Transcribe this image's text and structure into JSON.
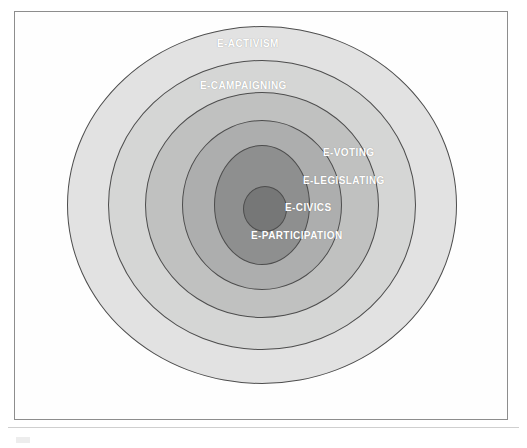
{
  "figure": {
    "frame_color": "#8d8d8d",
    "background": "#ffffff",
    "label_color": "#ffffff",
    "ring_outline_color": "#4d4d4d"
  },
  "chart_data": {
    "type": "pie",
    "title": "",
    "subtitle": "",
    "xlabel": "",
    "ylabel": "",
    "legend_position": "none",
    "grid": false,
    "layout": "concentric-rings",
    "center_label": "E-PARTICIPATION",
    "rings": [
      {
        "index": 1,
        "label": "E-ACTIVISM",
        "level": "outermost",
        "fill": "#e2e2e2",
        "radius_x": 195,
        "radius_y": 179,
        "label_position": "top"
      },
      {
        "index": 2,
        "label": "E-CAMPAIGNING",
        "level": "second",
        "fill": "#d5d6d5",
        "radius_x": 154,
        "radius_y": 145,
        "label_position": "top"
      },
      {
        "index": 3,
        "label": "E-VOTING",
        "level": "third",
        "fill": "#c0c1c0",
        "radius_x": 117,
        "radius_y": 113,
        "label_position": "right"
      },
      {
        "index": 4,
        "label": "E-LEGISLATING",
        "level": "fourth",
        "fill": "#adaeae",
        "radius_x": 80,
        "radius_y": 85,
        "label_position": "right"
      },
      {
        "index": 5,
        "label": "E-CIVICS",
        "level": "fifth",
        "fill": "#8e8f8f",
        "radius_x": 48,
        "radius_y": 60,
        "label_position": "right"
      },
      {
        "index": 6,
        "label": "E-PARTICIPATION",
        "level": "core",
        "fill": "#767777",
        "radius_x": 22,
        "radius_y": 23,
        "label_position": "center-right"
      }
    ],
    "labels": [
      "E-ACTIVISM",
      "E-CAMPAIGNING",
      "E-VOTING",
      "E-LEGISLATING",
      "E-CIVICS",
      "E-PARTICIPATION"
    ]
  }
}
